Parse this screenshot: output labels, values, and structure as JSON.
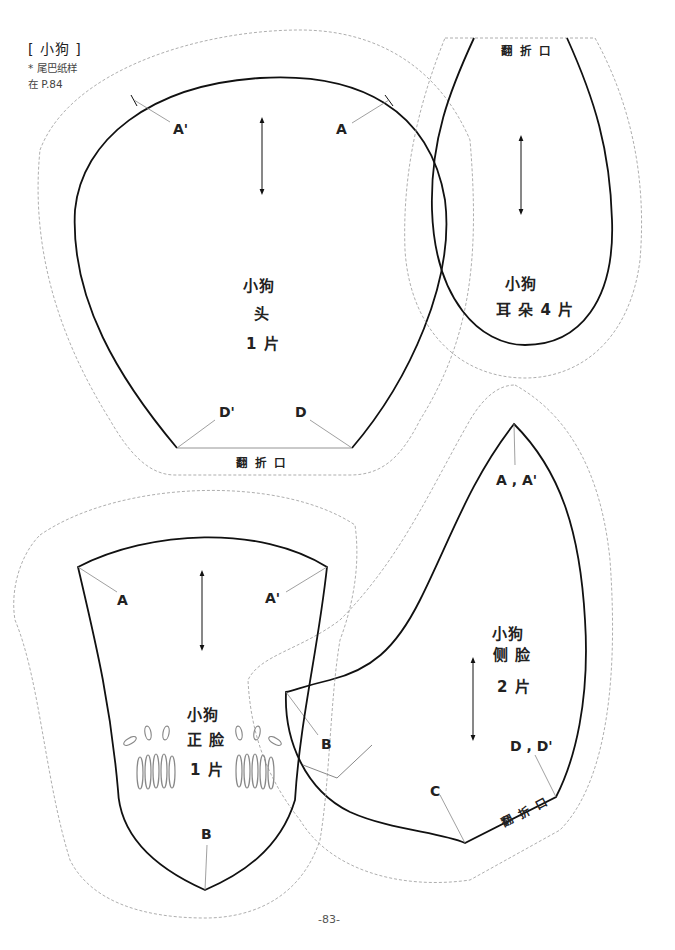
{
  "header": {
    "title": "[ 小狗 ]",
    "note_line1": "* 尾巴纸样",
    "note_line2": "在 P.84"
  },
  "pieces": {
    "head": {
      "name": "小狗",
      "part": "头",
      "count": "1 片",
      "marks": [
        "A'",
        "A",
        "D'",
        "D"
      ],
      "fold_label": "翻 折 口"
    },
    "ear": {
      "name": "小狗",
      "count": "耳 朵 4 片",
      "fold_label": "翻 折 口"
    },
    "front_face": {
      "name": "小狗",
      "part": "正 脸",
      "count": "1 片",
      "marks": [
        "A",
        "A'",
        "B"
      ]
    },
    "side_face": {
      "name": "小狗",
      "part": "侧 脸",
      "count": "2 片",
      "marks": [
        "A , A'",
        "B",
        "C",
        "D , D'"
      ],
      "fold_label": "翻 折 口"
    }
  },
  "footer": {
    "page_number": "-83-"
  },
  "colors": {
    "cut_line": "#111111",
    "seam_allowance": "#999999",
    "guide_line": "#888888"
  }
}
